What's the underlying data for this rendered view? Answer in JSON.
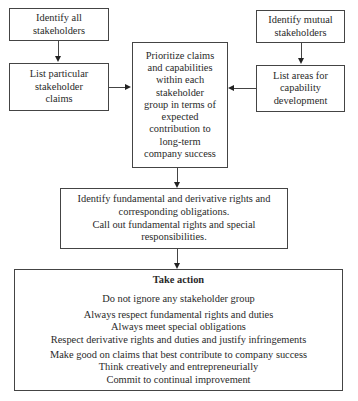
{
  "diagram": {
    "type": "flowchart",
    "left_column": {
      "identify_all": {
        "lines": [
          "Identify all",
          "stakeholders"
        ]
      },
      "list_claims": {
        "lines": [
          "List particular",
          "stakeholder",
          "claims"
        ]
      }
    },
    "right_column": {
      "identify_mutual": {
        "lines": [
          "Identify mutual",
          "stakeholders"
        ]
      },
      "list_areas": {
        "lines": [
          "List areas for",
          "capability",
          "development"
        ]
      }
    },
    "center": {
      "prioritize": {
        "lines": [
          "Prioritize claims",
          "and capabilities",
          "within each",
          "stakeholder",
          "group in terms of",
          "expected",
          "contribution to",
          "long-term",
          "company success"
        ]
      }
    },
    "rights": {
      "lines": [
        "Identify fundamental and derivative rights and",
        "corresponding obligations.",
        "Call out fundamental rights and special",
        "responsibilities."
      ]
    },
    "take_action": {
      "title": "Take action",
      "groups": [
        [
          "Do not ignore any stakeholder group"
        ],
        [
          "Always respect fundamental rights and duties",
          "Always meet special obligations",
          "Respect derivative rights and duties and justify infringements"
        ],
        [
          "Make good on claims that best contribute to company success",
          "Think creatively and entrepreneurially",
          "Commit to continual improvement"
        ]
      ]
    },
    "edges": [
      {
        "from": "Identify all stakeholders",
        "to": "List particular stakeholder claims"
      },
      {
        "from": "List particular stakeholder claims",
        "to": "Prioritize claims and capabilities"
      },
      {
        "from": "Identify mutual stakeholders",
        "to": "List areas for capability development"
      },
      {
        "from": "List areas for capability development",
        "to": "Prioritize claims and capabilities"
      },
      {
        "from": "Prioritize claims and capabilities",
        "to": "Identify fundamental and derivative rights"
      },
      {
        "from": "Identify fundamental and derivative rights",
        "to": "Take action"
      }
    ]
  }
}
